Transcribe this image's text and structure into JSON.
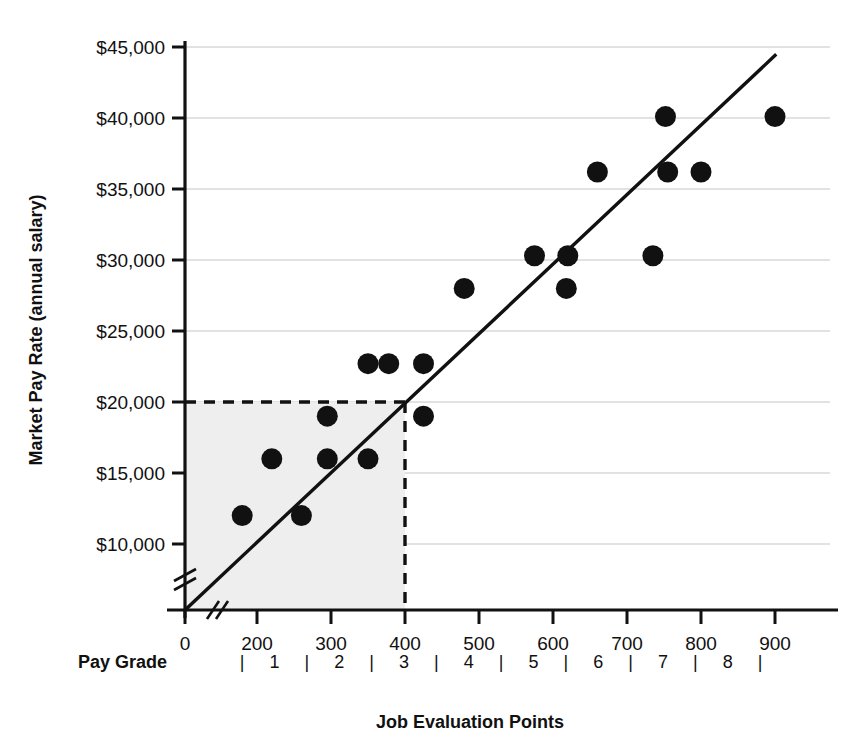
{
  "chart_data": {
    "type": "scatter",
    "title": "",
    "xlabel": "Job Evaluation Points",
    "ylabel": "Market Pay Rate (annual salary)",
    "xlim": [
      0,
      950
    ],
    "ylim": [
      0,
      45000
    ],
    "grid": true,
    "legend": null,
    "x_tick_labels": [
      "0",
      "200",
      "300",
      "400",
      "500",
      "600",
      "700",
      "800",
      "900"
    ],
    "x_tick_values": [
      0,
      200,
      300,
      400,
      500,
      600,
      700,
      800,
      900
    ],
    "y_tick_labels": [
      "$10,000",
      "$15,000",
      "$20,000",
      "$25,000",
      "$30,000",
      "$35,000",
      "$40,000",
      "$45,000"
    ],
    "y_tick_values": [
      10000,
      15000,
      20000,
      25000,
      30000,
      35000,
      40000,
      45000
    ],
    "axis_breaks": {
      "x_axis": true,
      "y_axis": true,
      "note": "double slash break marks near origin on both axes"
    },
    "points": [
      {
        "x": 180,
        "y": 12000
      },
      {
        "x": 260,
        "y": 12000
      },
      {
        "x": 220,
        "y": 16000
      },
      {
        "x": 295,
        "y": 16000
      },
      {
        "x": 350,
        "y": 16000
      },
      {
        "x": 295,
        "y": 19000
      },
      {
        "x": 425,
        "y": 19000
      },
      {
        "x": 350,
        "y": 22700
      },
      {
        "x": 378,
        "y": 22700
      },
      {
        "x": 425,
        "y": 22700
      },
      {
        "x": 480,
        "y": 28000
      },
      {
        "x": 618,
        "y": 28000
      },
      {
        "x": 575,
        "y": 30300
      },
      {
        "x": 620,
        "y": 30300
      },
      {
        "x": 735,
        "y": 30300
      },
      {
        "x": 660,
        "y": 36200
      },
      {
        "x": 755,
        "y": 36200
      },
      {
        "x": 800,
        "y": 36200
      },
      {
        "x": 752,
        "y": 40100
      },
      {
        "x": 900,
        "y": 40100
      }
    ],
    "trend_line": {
      "x0": 0,
      "y0": 0,
      "x1": 930,
      "y1": 45700,
      "style": "solid"
    },
    "highlight_region": {
      "x_from": 0,
      "x_to": 400,
      "y_from": 0,
      "y_to": 20000,
      "fill": "#eeeeee",
      "guide_x": 400,
      "guide_y": 20000,
      "guide_style": "dashed"
    },
    "secondary_axis": {
      "label": "Pay Grade",
      "grades": [
        "1",
        "2",
        "3",
        "4",
        "5",
        "6",
        "7",
        "8"
      ],
      "separator_glyph": "|"
    }
  },
  "colors": {
    "marker": "#111111",
    "trend": "#111111",
    "grid": "#d8d8d8",
    "region": "#eeeeee",
    "axis": "#111111",
    "text": "#111111",
    "background": "#ffffff"
  }
}
